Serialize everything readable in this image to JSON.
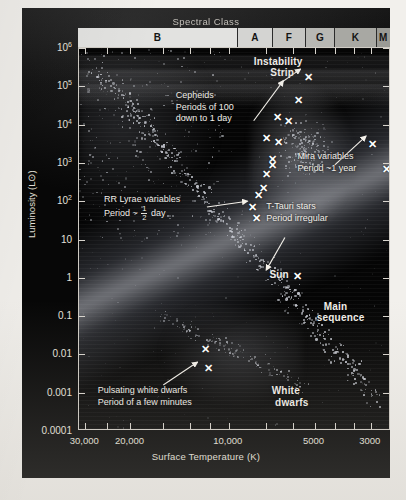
{
  "figure": {
    "spectral_class_title": "Spectral Class",
    "spectral_classes": [
      {
        "label": "B",
        "x_start_pct": 0.0,
        "x_end_pct": 51.3,
        "color": "#e2e2e0"
      },
      {
        "label": "A",
        "x_start_pct": 51.3,
        "x_end_pct": 62.5,
        "color": "#d4d4d2"
      },
      {
        "label": "F",
        "x_start_pct": 62.5,
        "x_end_pct": 73.1,
        "color": "#c6c6c3"
      },
      {
        "label": "G",
        "x_start_pct": 73.1,
        "x_end_pct": 82.4,
        "color": "#b8b8b4"
      },
      {
        "label": "K",
        "x_start_pct": 82.4,
        "x_end_pct": 95.8,
        "color": "#a8a8a3"
      },
      {
        "label": "M",
        "x_start_pct": 95.8,
        "x_end_pct": 100.0,
        "color": "#9a9a95"
      }
    ]
  },
  "chart_data": {
    "type": "scatter",
    "xlabel": "Surface Temperature (K)",
    "ylabel": "Luminosity (L⊙)",
    "xlim": [
      30000,
      2800
    ],
    "ylim": [
      0.0001,
      1000000
    ],
    "x_scale": "log-reversed",
    "y_scale": "log",
    "grid": false,
    "legend": "none",
    "xticks": [
      {
        "label": "30,000",
        "pos_pct": 2.0
      },
      {
        "label": "20,000",
        "pos_pct": 16.5
      },
      {
        "label": "10,000",
        "pos_pct": 48.0
      },
      {
        "label": "5000",
        "pos_pct": 75.5
      },
      {
        "label": "3000",
        "pos_pct": 93.5
      }
    ],
    "xticks_minor_pct": [
      2.0,
      9.0,
      16.5,
      27.0,
      35.5,
      42.0,
      48.0,
      60.0,
      68.5,
      75.5,
      82.0,
      88.0,
      93.5
    ],
    "yticks": [
      {
        "label": "10",
        "sup": "6",
        "pos_pct": 0.0
      },
      {
        "label": "10",
        "sup": "5",
        "pos_pct": 10.0
      },
      {
        "label": "10",
        "sup": "4",
        "pos_pct": 20.0
      },
      {
        "label": "10",
        "sup": "3",
        "pos_pct": 30.0
      },
      {
        "label": "10",
        "sup": "2",
        "pos_pct": 40.0
      },
      {
        "label": "10",
        "sup": "",
        "pos_pct": 50.0
      },
      {
        "label": "1",
        "sup": "",
        "pos_pct": 60.0
      },
      {
        "label": "0.1",
        "sup": "",
        "pos_pct": 70.0
      },
      {
        "label": "0.01",
        "sup": "",
        "pos_pct": 80.0
      },
      {
        "label": "0.001",
        "sup": "",
        "pos_pct": 90.0
      },
      {
        "label": "0.0001",
        "sup": "",
        "pos_pct": 100.0
      }
    ],
    "regions": [
      {
        "name": "Main sequence",
        "label": "Main\nsequence"
      },
      {
        "name": "White dwarfs",
        "label": "White\ndwarfs"
      },
      {
        "name": "Instability strip",
        "label": "Instability\nStrip"
      }
    ],
    "variable_star_markers_pct": [
      {
        "x": 73.5,
        "y": 7.5
      },
      {
        "x": 70.5,
        "y": 13.5
      },
      {
        "x": 67.0,
        "y": 19.0
      },
      {
        "x": 64.0,
        "y": 24.5
      },
      {
        "x": 62.0,
        "y": 29.0
      },
      {
        "x": 60.0,
        "y": 33.0
      },
      {
        "x": 59.0,
        "y": 36.5
      },
      {
        "x": 62.0,
        "y": 30.5
      },
      {
        "x": 57.5,
        "y": 38.5
      },
      {
        "x": 55.5,
        "y": 41.5
      },
      {
        "x": 60.0,
        "y": 23.5
      },
      {
        "x": 63.5,
        "y": 18.0
      },
      {
        "x": 94.0,
        "y": 25.0
      },
      {
        "x": 98.5,
        "y": 31.5
      },
      {
        "x": 40.5,
        "y": 78.5
      },
      {
        "x": 41.5,
        "y": 83.5
      },
      {
        "x": 57.0,
        "y": 44.5
      }
    ],
    "sun": {
      "label": "Sun",
      "x_pct": 70.0,
      "y_pct": 59.5,
      "temperature_K": 5800,
      "luminosity_Lsun": 1
    }
  },
  "annotations": [
    {
      "id": "instability-strip",
      "lines": [
        "Instability",
        "Strip"
      ],
      "bold": true,
      "x_pct": 56.0,
      "y_pct": 2.0,
      "arrow": {
        "from": [
          64.0,
          9.5
        ],
        "to": [
          71.0,
          5.5
        ]
      }
    },
    {
      "id": "cepheids",
      "lines": [
        "Cepheids",
        "Periods of 100",
        "down to 1 day"
      ],
      "bold": false,
      "x_pct": 31.0,
      "y_pct": 11.0,
      "arrow": {
        "from": [
          56.0,
          19.0
        ],
        "to": [
          65.5,
          8.5
        ]
      }
    },
    {
      "id": "rr-lyrae",
      "lines": [
        "RR Lyrae variables",
        "Period ~ 1/2 day"
      ],
      "bold": false,
      "x_pct": 8.0,
      "y_pct": 38.0,
      "arrow": {
        "from": [
          41.0,
          41.5
        ],
        "to": [
          54.0,
          40.0
        ]
      }
    },
    {
      "id": "mira-variables",
      "lines": [
        "Mira variables",
        "Period ~1 year"
      ],
      "bold": false,
      "x_pct": 70.0,
      "y_pct": 27.0,
      "arrow": {
        "from": [
          82.0,
          30.5
        ],
        "to": [
          92.0,
          23.0
        ]
      }
    },
    {
      "id": "t-tauri-stars",
      "lines": [
        "T-Tauri stars",
        "Period irregular"
      ],
      "bold": false,
      "x_pct": 60.0,
      "y_pct": 40.0,
      "arrow": {
        "from": [
          66.0,
          49.5
        ],
        "to": [
          60.0,
          58.0
        ]
      }
    },
    {
      "id": "pulsating-white-dwarfs",
      "lines": [
        "Pulsating white dwarfs",
        "Period of a few minutes"
      ],
      "bold": false,
      "x_pct": 6.0,
      "y_pct": 88.0,
      "arrow": {
        "from": [
          27.0,
          88.0
        ],
        "to": [
          38.0,
          82.0
        ]
      }
    },
    {
      "id": "main-sequence",
      "lines": [
        "Main",
        "sequence"
      ],
      "bold": true,
      "x_pct": 73.0,
      "y_pct": 66.0,
      "arrow": null
    },
    {
      "id": "white-dwarfs",
      "lines": [
        "White",
        "dwarfs"
      ],
      "bold": true,
      "x_pct": 59.0,
      "y_pct": 88.0,
      "arrow": null
    }
  ]
}
